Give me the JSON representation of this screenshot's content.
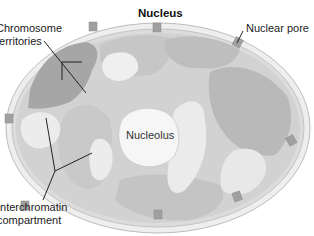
{
  "diagram": {
    "title": "Nucleus",
    "labels": {
      "chromosome_territories_line1": "Chromosome",
      "chromosome_territories_line2": "territories",
      "nuclear_pore": "Nuclear pore",
      "nucleolus": "Nucleolus",
      "interchromatin_line1": "Interchromatin",
      "interchromatin_line2": "compartment"
    },
    "colors": {
      "envelope": "#e6e6e6",
      "envelope_stroke": "#bdbdbd",
      "nucleoplasm": "#d4d4d4",
      "territory_dark": "#a9a9a9",
      "territory_mid": "#c2c2c2",
      "interchromatin": "#ececec",
      "nucleolus": "#f7f7f7",
      "pore": "#9a9a9a",
      "leader_line": "#222222"
    }
  }
}
